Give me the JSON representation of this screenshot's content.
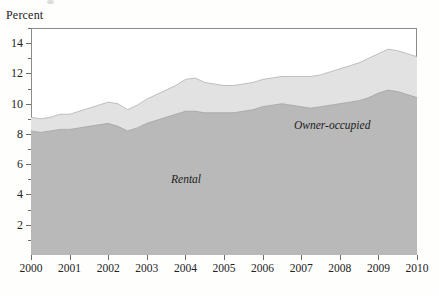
{
  "figure": {
    "axis_title": "Percent",
    "series_labels": {
      "rental": "Rental",
      "owner": "Owner-occupied"
    }
  },
  "chart_data": {
    "type": "area",
    "stacked": true,
    "title": "",
    "subtitle": "",
    "xlabel": "",
    "ylabel": "Percent",
    "xlim": [
      2000,
      2010
    ],
    "ylim": [
      0,
      15
    ],
    "ytick_labels": [
      "2",
      "4",
      "6",
      "8",
      "10",
      "12",
      "14"
    ],
    "ytick_values": [
      2,
      4,
      6,
      8,
      10,
      12,
      14
    ],
    "yminor_values": [
      1,
      3,
      5,
      7,
      9,
      11,
      13,
      15
    ],
    "xtick_labels": [
      "2000",
      "2001",
      "2002",
      "2003",
      "2004",
      "2005",
      "2006",
      "2007",
      "2008",
      "2009",
      "2010"
    ],
    "xtick_values": [
      2000,
      2001,
      2002,
      2003,
      2004,
      2005,
      2006,
      2007,
      2008,
      2009,
      2010
    ],
    "grid": false,
    "legend_position": "inline-annotation",
    "x": [
      2000.0,
      2000.25,
      2000.5,
      2000.75,
      2001.0,
      2001.25,
      2001.5,
      2001.75,
      2002.0,
      2002.25,
      2002.5,
      2002.75,
      2003.0,
      2003.25,
      2003.5,
      2003.75,
      2004.0,
      2004.25,
      2004.5,
      2004.75,
      2005.0,
      2005.25,
      2005.5,
      2005.75,
      2006.0,
      2006.25,
      2006.5,
      2006.75,
      2007.0,
      2007.25,
      2007.5,
      2007.75,
      2008.0,
      2008.25,
      2008.5,
      2008.75,
      2009.0,
      2009.25,
      2009.5,
      2009.75,
      2010.0
    ],
    "series": [
      {
        "name": "Rental",
        "color": "#b9b9b9",
        "values": [
          8.2,
          8.1,
          8.2,
          8.3,
          8.3,
          8.4,
          8.5,
          8.6,
          8.7,
          8.5,
          8.2,
          8.4,
          8.7,
          8.9,
          9.1,
          9.3,
          9.5,
          9.5,
          9.4,
          9.4,
          9.4,
          9.4,
          9.5,
          9.6,
          9.8,
          9.9,
          10.0,
          9.9,
          9.8,
          9.7,
          9.8,
          9.9,
          10.0,
          10.1,
          10.2,
          10.4,
          10.7,
          10.9,
          10.8,
          10.6,
          10.4
        ]
      },
      {
        "name": "Owner-occupied",
        "color": "#e2e2e2",
        "values": [
          0.9,
          0.9,
          0.9,
          1.0,
          1.0,
          1.1,
          1.2,
          1.3,
          1.4,
          1.5,
          1.4,
          1.5,
          1.6,
          1.7,
          1.8,
          1.9,
          2.1,
          2.2,
          2.0,
          1.9,
          1.8,
          1.8,
          1.8,
          1.8,
          1.8,
          1.8,
          1.8,
          1.9,
          2.0,
          2.1,
          2.1,
          2.2,
          2.3,
          2.4,
          2.5,
          2.6,
          2.6,
          2.7,
          2.7,
          2.7,
          2.7
        ]
      }
    ],
    "totals": [
      9.1,
      9.0,
      9.1,
      9.3,
      9.3,
      9.5,
      9.7,
      9.9,
      10.1,
      10.0,
      9.6,
      9.9,
      10.3,
      10.6,
      10.9,
      11.2,
      11.6,
      11.7,
      11.4,
      11.3,
      11.2,
      11.2,
      11.3,
      11.4,
      11.6,
      11.7,
      11.8,
      11.8,
      11.8,
      11.8,
      11.9,
      12.1,
      12.3,
      12.5,
      12.7,
      13.0,
      13.3,
      13.6,
      13.5,
      13.3,
      13.1
    ]
  },
  "colors": {
    "rental_fill": "#b9b9b9",
    "owner_fill": "#e2e2e2",
    "frame": "#8b8b8b",
    "text": "#232323",
    "background": "#fefefd"
  }
}
